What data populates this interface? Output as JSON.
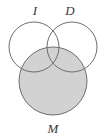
{
  "figure": {
    "type": "venn-diagram",
    "title": "",
    "background_color": "#ffffff",
    "outline_color": "#6e6e6e",
    "shade_color": "#d2d2d2",
    "label_color": "#3a3a3a"
  },
  "labels": {
    "left_set": "I",
    "right_set": "D",
    "bottom_set": "M"
  },
  "sets": [
    {
      "id": "I",
      "label": "I",
      "position": "top-left",
      "cx": 34,
      "cy": 47,
      "r": 25,
      "shaded": "false",
      "label_x": 35,
      "label_y": 15
    },
    {
      "id": "D",
      "label": "D",
      "position": "top-right",
      "cx": 72,
      "cy": 47,
      "r": 25,
      "shaded": "false",
      "label_x": 70,
      "label_y": 15
    },
    {
      "id": "M",
      "label": "M",
      "position": "bottom-center",
      "cx": 53,
      "cy": 81,
      "r": 34,
      "shaded": "true",
      "label_x": 53,
      "label_y": 133
    }
  ],
  "shaded_regions": [
    "M"
  ]
}
